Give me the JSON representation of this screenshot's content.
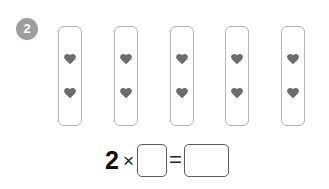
{
  "worksheet": {
    "question_number": "2",
    "badge_color": "#9e9e9e",
    "background_color": "#ffffff"
  },
  "groups": {
    "card_border_color": "#b5b5b5",
    "icon_name": "heart-icon",
    "icon_color": "#6b6b6b",
    "count": 5,
    "items_per_group": 2,
    "cards": [
      {
        "label": "group-1",
        "icons": [
          "heart-icon",
          "heart-icon"
        ]
      },
      {
        "label": "group-2",
        "icons": [
          "heart-icon",
          "heart-icon"
        ]
      },
      {
        "label": "group-3",
        "icons": [
          "heart-icon",
          "heart-icon"
        ]
      },
      {
        "label": "group-4",
        "icons": [
          "heart-icon",
          "heart-icon"
        ]
      },
      {
        "label": "group-5",
        "icons": [
          "heart-icon",
          "heart-icon"
        ]
      }
    ]
  },
  "equation": {
    "multiplicand": "2",
    "times_symbol": "×",
    "equals_symbol": "=",
    "factor_box_value": "",
    "factor_box_placeholder": "",
    "result_box_value": "",
    "result_box_placeholder": ""
  }
}
